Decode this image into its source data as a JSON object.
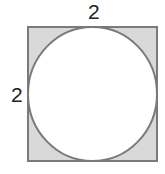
{
  "figure": {
    "square": {
      "side_label_top": "2",
      "side_label_left": "2",
      "fill": "#d9d9d9",
      "stroke": "#777777"
    },
    "circle": {
      "fill": "#ffffff",
      "stroke": "#777777"
    }
  }
}
